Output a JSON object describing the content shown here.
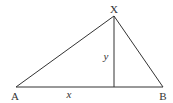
{
  "diagram": {
    "type": "triangle-with-altitude",
    "stroke_color": "#333333",
    "vertices": {
      "A": {
        "label": "A",
        "x": 16,
        "y": 87
      },
      "B": {
        "label": "B",
        "x": 163,
        "y": 87
      },
      "X": {
        "label": "X",
        "x": 114,
        "y": 16
      }
    },
    "altitude_foot": {
      "x": 114,
      "y": 87
    },
    "segment_labels": {
      "base_part": "x",
      "height": "y"
    }
  }
}
